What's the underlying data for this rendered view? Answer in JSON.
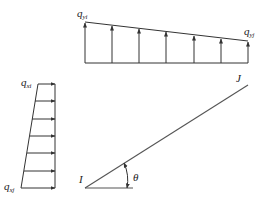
{
  "diagram": {
    "colors": {
      "stroke": "#333333",
      "element": "#555555",
      "background": "#ffffff"
    },
    "top_load": {
      "label_left": "q",
      "label_left_sub": "yi",
      "label_right": "q",
      "label_right_sub": "yj",
      "arrow_count": 7,
      "direction": "up"
    },
    "left_load": {
      "label_top": "q",
      "label_top_sub": "xi",
      "label_bottom": "q",
      "label_bottom_sub": "xj",
      "arrow_count": 7,
      "direction": "right"
    },
    "element": {
      "node_start": "I",
      "node_end": "J",
      "angle_label": "θ"
    }
  }
}
